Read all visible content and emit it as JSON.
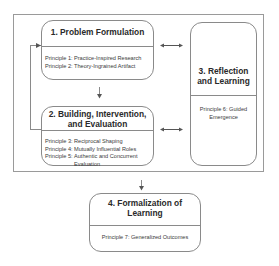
{
  "diagram": {
    "boxes": [
      {
        "id": "1",
        "title": "1.  Problem Formulation",
        "principles": [
          {
            "label": "Principle 1:",
            "text": "Practice-Inspired Research"
          },
          {
            "label": "Principle 2:",
            "text": "Theory-Ingrained Artifact"
          }
        ]
      },
      {
        "id": "2",
        "title_line1": "2.  Building, Intervention,",
        "title_line2": "and Evaluation",
        "principles": [
          {
            "label": "Principle 3:",
            "text": "Reciprocal Shaping"
          },
          {
            "label": "Principle 4:",
            "text": "Mutually Influential Roles"
          },
          {
            "label": "Principle 5:",
            "text": "Authentic and Concurrent Evaluation"
          }
        ]
      },
      {
        "id": "3",
        "title_line1": "3.  Reflection",
        "title_line2": "and Learning",
        "principles": [
          {
            "text_line1": "Principle 6:  Guided",
            "text_line2": "Emergence"
          }
        ]
      },
      {
        "id": "4",
        "title_line1": "4. Formalization of",
        "title_line2": "Learning",
        "principles": [
          {
            "text": "Principle 7:  Generalized Outcomes"
          }
        ]
      }
    ],
    "connectors": [
      {
        "from": "1",
        "to": "2",
        "type": "down-arrow"
      },
      {
        "from": "2",
        "to": "1",
        "type": "feedback-loop"
      },
      {
        "from": "1",
        "to": "3",
        "type": "bidirectional-arrow"
      },
      {
        "from": "2",
        "to": "3",
        "type": "bidirectional-arrow"
      },
      {
        "from": "frame",
        "to": "4",
        "type": "down-arrow"
      }
    ],
    "colors": {
      "line": "#8a8a8a",
      "frame": "#9a9a9a",
      "text": "#2a2a2a"
    }
  }
}
